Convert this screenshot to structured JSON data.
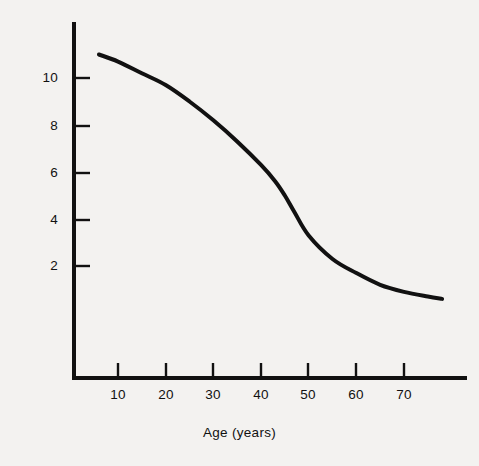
{
  "figure": {
    "background_color": "#f3f2f0",
    "ink_color": "#111111"
  },
  "axes": {
    "x_title": "Age (years)",
    "y_title": "Accommodation of eye (D)",
    "x_tick_labels": [
      "10",
      "20",
      "30",
      "40",
      "50",
      "60",
      "70"
    ],
    "y_tick_labels": [
      "2",
      "4",
      "6",
      "8",
      "10"
    ]
  },
  "chart_data": {
    "type": "line",
    "title": "",
    "subtitle": "",
    "xlabel": "Age (years)",
    "ylabel": "Accommodation of eye (D)",
    "xlim": [
      0,
      80
    ],
    "ylim": [
      0,
      11.6
    ],
    "grid": false,
    "legend": null,
    "annotations": [],
    "x_ticks": [
      10,
      20,
      30,
      40,
      50,
      60,
      70
    ],
    "y_ticks": [
      2,
      4,
      6,
      8,
      10
    ],
    "series": [
      {
        "name": "Accommodation of eye",
        "color": "#111111",
        "line_width": 4,
        "x": [
          6,
          10,
          15,
          20,
          25,
          30,
          35,
          40,
          43,
          45,
          47,
          50,
          55,
          60,
          65,
          70,
          75,
          78
        ],
        "values": [
          11.0,
          10.7,
          10.2,
          9.7,
          9.0,
          8.2,
          7.3,
          6.3,
          5.6,
          5.0,
          4.3,
          3.3,
          2.3,
          1.7,
          1.2,
          0.9,
          0.7,
          0.6
        ]
      }
    ]
  }
}
